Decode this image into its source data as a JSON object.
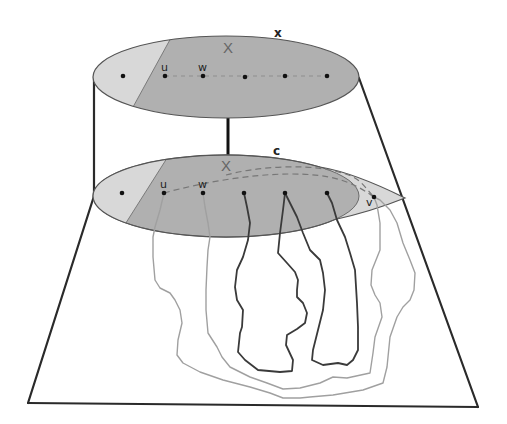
{
  "diagram": {
    "top_ellipse": {
      "region_label": "X",
      "curve_label": "x",
      "vertex_labels": {
        "u": "u",
        "w": "w"
      },
      "vertex_count": 6
    },
    "bottom_ellipse": {
      "region_label": "X",
      "curve_label": "c",
      "vertex_labels": {
        "u": "u",
        "w": "w",
        "v": "v"
      },
      "vertex_count": 7
    },
    "colors": {
      "region_dark": "#b0b0b0",
      "region_light": "#d8d8d8",
      "dark_paths": "#3a3a3a",
      "light_paths": "#a0a0a0",
      "frame": "#2a2a2a"
    }
  }
}
